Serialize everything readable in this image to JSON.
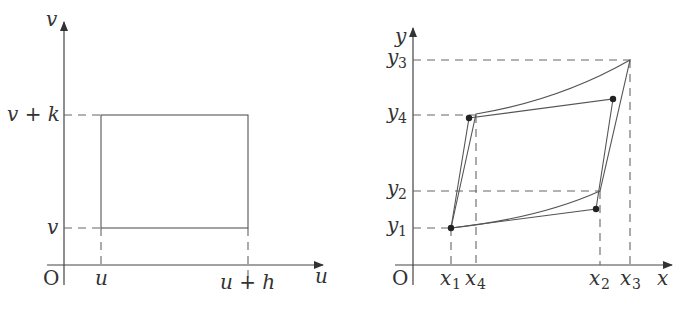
{
  "left_diagram": {
    "title": "uv-plane rectangle",
    "origin_label": "O",
    "x_axis_label": "u",
    "y_axis_label": "v",
    "x_ticks": [
      {
        "label": "u",
        "x": 101
      },
      {
        "label": "u + h",
        "x": 248
      }
    ],
    "y_ticks": [
      {
        "label": "v + k",
        "y": 115
      },
      {
        "label": "v",
        "y": 228
      }
    ],
    "shape": "rectangle"
  },
  "right_diagram": {
    "title": "xy-plane image region",
    "origin_label": "O",
    "x_axis_label": "x",
    "y_axis_label": "y",
    "x_ticks": [
      {
        "base": "x",
        "sub": "1",
        "x": 451
      },
      {
        "base": "x",
        "sub": "4",
        "x": 476
      },
      {
        "base": "x",
        "sub": "2",
        "x": 600
      },
      {
        "base": "x",
        "sub": "3",
        "x": 630
      }
    ],
    "y_ticks": [
      {
        "base": "y",
        "sub": "3",
        "y": 60
      },
      {
        "base": "y",
        "sub": "4",
        "y": 115
      },
      {
        "base": "y",
        "sub": "2",
        "y": 191
      },
      {
        "base": "y",
        "sub": "1",
        "y": 228
      }
    ],
    "curved_region_vertices": [
      "(x1,y1)",
      "(x2,y2)",
      "(x3,y3)",
      "(x4,y4)"
    ],
    "parallelogram_dots": 4
  }
}
